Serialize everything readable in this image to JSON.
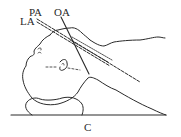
{
  "diagram": {
    "type": "anatomical-positioning-illustration",
    "labels": {
      "pa": "PA",
      "la": "LA",
      "oa": "OA",
      "c": "C"
    },
    "elements": [
      {
        "id": "head-profile",
        "description": "Head in lateral view, tilted back, resting on a support"
      },
      {
        "id": "ear",
        "description": "Ear with dashed horizontal reference line"
      },
      {
        "id": "head-support",
        "description": "Rounded cushion under occiput"
      },
      {
        "id": "table-line",
        "description": "Horizontal baseline (C)"
      },
      {
        "id": "neck-torso",
        "description": "Neck/shoulder outline sloping down to baseline"
      },
      {
        "id": "hand-arm",
        "description": "Arm/hand outline along upper right"
      },
      {
        "id": "line-pa",
        "description": "Dashed line PA"
      },
      {
        "id": "line-la",
        "description": "Dashed line LA"
      },
      {
        "id": "line-oa",
        "description": "Solid line OA"
      }
    ],
    "colors": {
      "ink": "#2a2a2a",
      "background": "#ffffff"
    }
  }
}
